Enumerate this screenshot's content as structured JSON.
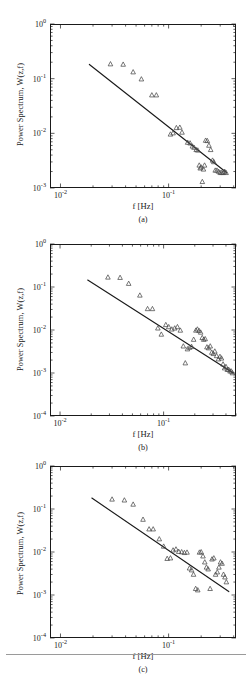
{
  "figure": {
    "xlabel": "f [Hz]",
    "ylabel": "Power Spectrum, W(z,f)",
    "marker": "triangle-up-open",
    "line_color": "#1a1a1a",
    "marker_color": "#4a4a4a",
    "panels": [
      {
        "id": "a",
        "caption": "(a)"
      },
      {
        "id": "b",
        "caption": "(b)"
      },
      {
        "id": "c",
        "caption": "(c)"
      }
    ]
  },
  "ticks": {
    "x_labels": [
      "10",
      "10"
    ],
    "x_exponents": [
      "-2",
      "-1"
    ],
    "y_labels_a": [
      "10",
      "10",
      "10",
      "10"
    ],
    "y_exponents_a": [
      "0",
      "-1",
      "-2",
      "-3"
    ],
    "y_labels_bc": [
      "10",
      "10",
      "10",
      "10",
      "10"
    ],
    "y_exponents_bc": [
      "0",
      "-1",
      "-2",
      "-3",
      "-4"
    ]
  },
  "chart_data": [
    {
      "type": "scatter",
      "panel": "(a)",
      "title": "",
      "xlabel": "f [Hz]",
      "ylabel": "Power Spectrum, W(z,f)",
      "xscale": "log",
      "yscale": "log",
      "xlim": [
        0.008,
        0.42
      ],
      "ylim": [
        0.001,
        1.0
      ],
      "xticks": [
        0.01,
        0.1
      ],
      "yticks": [
        0.001,
        0.01,
        0.1,
        1.0
      ],
      "grid": false,
      "legend": null,
      "series": [
        {
          "name": "measured spectrum",
          "marker": "triangle-up-open",
          "x": [
            0.029,
            0.038,
            0.047,
            0.056,
            0.07,
            0.077,
            0.104,
            0.11,
            0.118,
            0.127,
            0.133,
            0.15,
            0.158,
            0.166,
            0.172,
            0.18,
            0.186,
            0.192,
            0.196,
            0.2,
            0.205,
            0.21,
            0.215,
            0.22,
            0.228,
            0.236,
            0.245,
            0.255,
            0.262,
            0.27,
            0.28,
            0.29,
            0.3,
            0.31,
            0.32,
            0.33,
            0.34
          ],
          "y": [
            0.185,
            0.182,
            0.132,
            0.098,
            0.05,
            0.05,
            0.0096,
            0.0101,
            0.0126,
            0.0128,
            0.0104,
            0.0068,
            0.0066,
            0.0058,
            0.0055,
            0.005,
            0.0049,
            0.0026,
            0.0023,
            0.0024,
            0.0013,
            0.0022,
            0.0026,
            0.0074,
            0.0073,
            0.006,
            0.005,
            0.0032,
            0.003,
            0.0021,
            0.0021,
            0.002,
            0.0019,
            0.0019,
            0.0019,
            0.002,
            0.0019
          ]
        }
      ],
      "fit_line": {
        "name": "power-law fit",
        "x": [
          0.0185,
          0.345
        ],
        "y": [
          0.182,
          0.0019
        ],
        "slope_loglog": -1.56
      }
    },
    {
      "type": "scatter",
      "panel": "(b)",
      "title": "",
      "xlabel": "f [Hz]",
      "ylabel": "Power Spectrum, W(z,f)",
      "xscale": "log",
      "yscale": "log",
      "xlim": [
        0.008,
        0.5
      ],
      "ylim": [
        0.0001,
        1.0
      ],
      "xticks": [
        0.01,
        0.1
      ],
      "yticks": [
        0.0001,
        0.001,
        0.01,
        0.1,
        1.0
      ],
      "grid": false,
      "legend": null,
      "series": [
        {
          "name": "measured spectrum",
          "marker": "triangle-up-open",
          "x": [
            0.029,
            0.038,
            0.046,
            0.059,
            0.07,
            0.078,
            0.088,
            0.095,
            0.105,
            0.112,
            0.12,
            0.128,
            0.136,
            0.145,
            0.155,
            0.162,
            0.17,
            0.178,
            0.186,
            0.195,
            0.205,
            0.212,
            0.22,
            0.228,
            0.236,
            0.244,
            0.252,
            0.262,
            0.272,
            0.282,
            0.292,
            0.302,
            0.312,
            0.325,
            0.338,
            0.35,
            0.362,
            0.375,
            0.388,
            0.4,
            0.412,
            0.425,
            0.438,
            0.45,
            0.462
          ],
          "y": [
            0.168,
            0.165,
            0.12,
            0.064,
            0.031,
            0.031,
            0.011,
            0.0079,
            0.0132,
            0.0118,
            0.0104,
            0.011,
            0.0118,
            0.0098,
            0.0042,
            0.0017,
            0.0036,
            0.0039,
            0.0041,
            0.006,
            0.0098,
            0.0104,
            0.0096,
            0.0088,
            0.0066,
            0.006,
            0.0062,
            0.004,
            0.0038,
            0.0042,
            0.003,
            0.0028,
            0.0032,
            0.0025,
            0.0021,
            0.0024,
            0.0022,
            0.0016,
            0.0013,
            0.0014,
            0.0012,
            0.0012,
            0.0011,
            0.0011,
            0.001
          ]
        }
      ],
      "fit_line": {
        "name": "power-law fit",
        "x": [
          0.0185,
          0.47
        ],
        "y": [
          0.145,
          0.001
        ],
        "slope_loglog": -1.53
      }
    },
    {
      "type": "scatter",
      "panel": "(c)",
      "title": "",
      "xlabel": "f [Hz]",
      "ylabel": "Power Spectrum, W(z,f)",
      "xscale": "log",
      "yscale": "log",
      "xlim": [
        0.008,
        0.42
      ],
      "ylim": [
        0.0001,
        1.0
      ],
      "xticks": [
        0.01,
        0.1
      ],
      "yticks": [
        0.0001,
        0.001,
        0.01,
        0.1,
        1.0
      ],
      "grid": false,
      "legend": null,
      "series": [
        {
          "name": "measured spectrum",
          "marker": "triangle-up-open",
          "x": [
            0.03,
            0.039,
            0.047,
            0.058,
            0.066,
            0.072,
            0.082,
            0.09,
            0.097,
            0.104,
            0.11,
            0.117,
            0.124,
            0.132,
            0.14,
            0.148,
            0.156,
            0.163,
            0.17,
            0.178,
            0.186,
            0.193,
            0.2,
            0.208,
            0.216,
            0.224,
            0.232,
            0.242,
            0.252,
            0.262,
            0.272,
            0.282,
            0.292,
            0.302,
            0.312,
            0.322,
            0.332,
            0.342
          ],
          "y": [
            0.168,
            0.16,
            0.128,
            0.057,
            0.034,
            0.034,
            0.02,
            0.0135,
            0.007,
            0.0072,
            0.011,
            0.0116,
            0.0102,
            0.01,
            0.0096,
            0.0098,
            0.0042,
            0.0038,
            0.003,
            0.0014,
            0.0013,
            0.0098,
            0.01,
            0.008,
            0.0058,
            0.0044,
            0.004,
            0.0014,
            0.0068,
            0.0072,
            0.003,
            0.0034,
            0.0044,
            0.0058,
            0.0054,
            0.003,
            0.0026,
            0.002
          ]
        }
      ],
      "fit_line": {
        "name": "power-law fit",
        "x": [
          0.0195,
          0.36
        ],
        "y": [
          0.18,
          0.0012
        ],
        "slope_loglog": -1.72
      }
    }
  ]
}
